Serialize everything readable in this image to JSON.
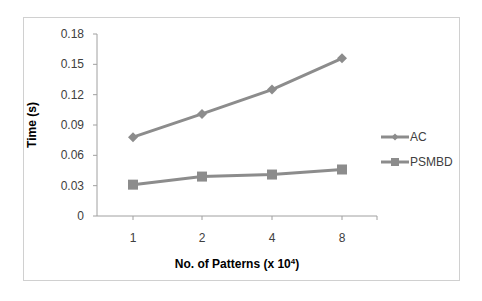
{
  "chart_data": {
    "type": "line",
    "title": "",
    "xlabel": "No. of Patterns (x 10",
    "xlabel_sup": "4",
    "xlabel_close": ")",
    "ylabel": "Time (s)",
    "categories": [
      "1",
      "2",
      "4",
      "8"
    ],
    "yticks": [
      "0",
      "0.03",
      "0.06",
      "0.09",
      "0.12",
      "0.15",
      "0.18"
    ],
    "ylim": [
      0,
      0.18
    ],
    "grid": false,
    "legend_position": "right",
    "series": [
      {
        "name": "AC",
        "marker": "diamond",
        "color": "#8c8c8c",
        "values": [
          0.078,
          0.101,
          0.125,
          0.156
        ]
      },
      {
        "name": "PSMBD",
        "marker": "square",
        "color": "#8c8c8c",
        "values": [
          0.031,
          0.039,
          0.041,
          0.046
        ]
      }
    ]
  }
}
